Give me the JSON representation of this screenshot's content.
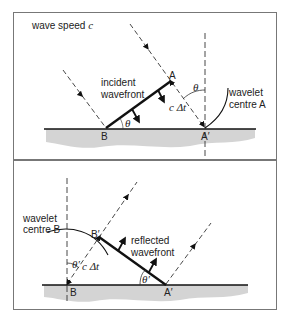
{
  "top_panel": {
    "title": "wave speed",
    "title_var": "c",
    "wavefront_label_1": "incident",
    "wavefront_label_2": "wavefront",
    "point_A": "A",
    "point_B": "B",
    "point_A_prime": "A′",
    "angle_label": "θ",
    "distance_label": "c Δt",
    "wavelet_label_1": "wavelet",
    "wavelet_label_2": "centre A"
  },
  "bottom_panel": {
    "wavelet_label_1": "wavelet",
    "wavelet_label_2": "centre B",
    "point_B": "B",
    "point_B_prime": "B′",
    "point_A_prime": "A′",
    "angle_label": "θ′",
    "distance_label": "c Δt",
    "wavefront_label_1": "reflected",
    "wavefront_label_2": "wavefront"
  },
  "colors": {
    "surface_fill": "#d0d0d0",
    "line": "#111111",
    "frame": "#777777"
  }
}
